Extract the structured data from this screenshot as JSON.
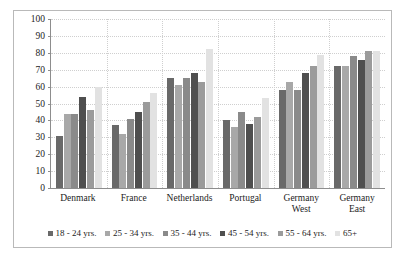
{
  "chart_data": {
    "type": "bar",
    "title": "",
    "xlabel": "",
    "ylabel": "",
    "ylim": [
      0,
      100
    ],
    "ytick_step": 10,
    "yticks": [
      "100",
      "90",
      "80",
      "70",
      "60",
      "50",
      "40",
      "30",
      "20",
      "10",
      "0"
    ],
    "grid": true,
    "legend_position": "bottom",
    "categories": [
      "Denmark",
      "France",
      "Netherlands",
      "Portugal",
      "Germany West",
      "Germany East"
    ],
    "category_labels": [
      [
        "Denmark"
      ],
      [
        "France"
      ],
      [
        "Netherlands"
      ],
      [
        "Portugal"
      ],
      [
        "Germany",
        "West"
      ],
      [
        "Germany",
        "East"
      ]
    ],
    "series": [
      {
        "name": "18 - 24 yrs.",
        "color": "#696969",
        "values": [
          31,
          37,
          65,
          40,
          58,
          72
        ]
      },
      {
        "name": "25 - 34 yrs.",
        "color": "#a8a8a8",
        "values": [
          44,
          32,
          61,
          36,
          63,
          72
        ]
      },
      {
        "name": "35 - 44 yrs.",
        "color": "#8a8a8a",
        "values": [
          44,
          41,
          65,
          45,
          58,
          78
        ]
      },
      {
        "name": "45 - 54 yrs.",
        "color": "#4f4f4f",
        "values": [
          54,
          45,
          68,
          38,
          68,
          76
        ]
      },
      {
        "name": "55 - 64 yrs.",
        "color": "#9b9b9b",
        "values": [
          46,
          51,
          63,
          42,
          72,
          81
        ]
      },
      {
        "name": "65+",
        "color": "#e2e2e2",
        "values": [
          60,
          56,
          82,
          53,
          79,
          81
        ]
      }
    ]
  }
}
